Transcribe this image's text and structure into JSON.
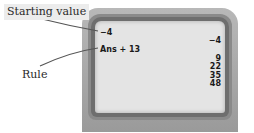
{
  "labels": {
    "starting_value": "Starting value",
    "rule": "Rule"
  },
  "screen": {
    "entries": {
      "start": "−4",
      "rule": "Ans + 13"
    },
    "results": [
      "−4",
      "9",
      "22",
      "35",
      "48"
    ]
  },
  "colors": {
    "bezel": "#a8a8a8",
    "screen": "#e4e4e4",
    "text": "#1a1a1a"
  }
}
